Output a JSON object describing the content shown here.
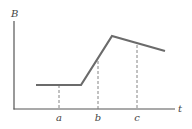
{
  "chart_data": {
    "type": "line",
    "title": "",
    "xlabel": "t",
    "ylabel": "B",
    "grid": false,
    "legend": null,
    "x_ticks": [
      "a",
      "b",
      "c"
    ],
    "series": [
      {
        "name": "B(t)",
        "points": [
          {
            "x": 36,
            "y": 85
          },
          {
            "x": 81,
            "y": 85
          },
          {
            "x": 112,
            "y": 36
          },
          {
            "x": 165,
            "y": 51
          }
        ]
      }
    ],
    "markers": [
      {
        "label": "a",
        "x": 59,
        "y_top": 85
      },
      {
        "label": "b",
        "x": 98,
        "y_top": 61
      },
      {
        "label": "c",
        "x": 137,
        "y_top": 45
      }
    ]
  },
  "axes": {
    "x_label": "t",
    "y_label": "B"
  },
  "colors": {
    "curve": "#6b6b6b",
    "axis": "#555555",
    "dashed": "#777777"
  }
}
